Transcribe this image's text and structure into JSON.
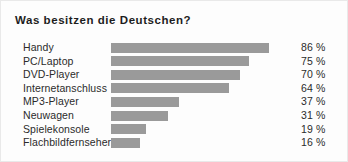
{
  "chart_data": {
    "type": "bar",
    "title": "Was besitzen die Deutschen?",
    "orientation": "horizontal",
    "xlabel": "",
    "ylabel": "",
    "xlim": [
      0,
      100
    ],
    "unit": "%",
    "grid": false,
    "legend": "none",
    "bar_color": "#9a9a9a",
    "background_color": "#fdfdfd",
    "text_color": "#2b2b2b",
    "categories": [
      "Handy",
      "PC/Laptop",
      "DVD-Player",
      "Internetanschluss",
      "MP3-Player",
      "Neuwagen",
      "Spielekonsole",
      "Flachbildfernseher"
    ],
    "values": [
      86,
      75,
      70,
      64,
      37,
      31,
      19,
      16
    ],
    "value_labels": [
      "86 %",
      "75 %",
      "70 %",
      "64 %",
      "37 %",
      "31 %",
      "19 %",
      "16 %"
    ]
  }
}
